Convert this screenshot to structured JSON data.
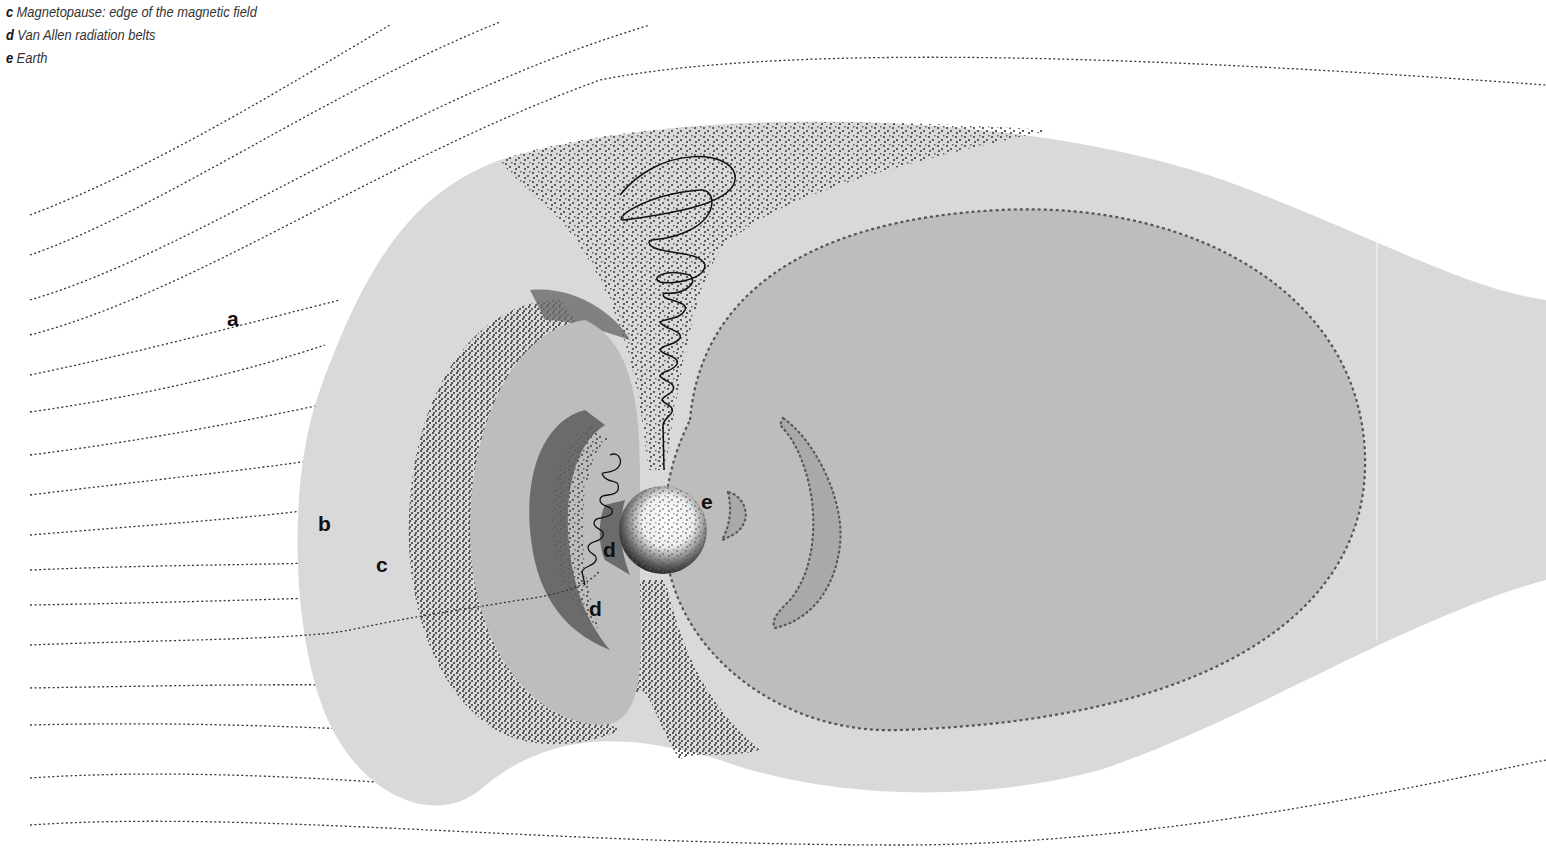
{
  "legend": {
    "items": [
      {
        "key": "c",
        "text": "Magnetopause: edge of the magnetic field"
      },
      {
        "key": "d",
        "text": "Van Allen radiation belts"
      },
      {
        "key": "e",
        "text": "Earth"
      }
    ]
  },
  "diagram": {
    "labels": {
      "a": "a",
      "b": "b",
      "c": "c",
      "d_upper": "d",
      "d_lower": "d",
      "e": "e"
    },
    "colors": {
      "background": "#ffffff",
      "outer_region": "#d9d9d9",
      "magnetotail": "#c4c4c4",
      "inner_region": "#bcbcbc",
      "stipple": "#5e5e5e",
      "belt": "#6a6a6a",
      "field_lines": "#333333",
      "earth_light": "#ffffff",
      "earth_dark": "#111111"
    }
  }
}
